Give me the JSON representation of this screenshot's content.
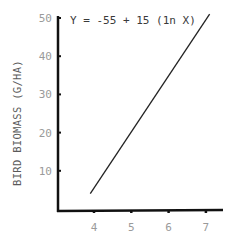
{
  "chart_data": {
    "type": "line",
    "title": "",
    "annotation": "Y = -55 + 15 (1n X)",
    "xlabel": "",
    "ylabel": "BIRD BIOMASS (G/HA)",
    "xlim": [
      3.0,
      7.4
    ],
    "ylim": [
      0,
      50
    ],
    "x_ticks": [
      4,
      5,
      6,
      7
    ],
    "y_ticks": [
      10,
      20,
      30,
      40,
      50
    ],
    "x_tick_labels": [
      "4",
      "5",
      "6",
      "7"
    ],
    "y_tick_labels": [
      "10",
      "20",
      "30",
      "40",
      "50"
    ],
    "grid": false,
    "legend": null,
    "series": [
      {
        "name": "Y = -55 + 15 (ln X)",
        "x": [
          3.9,
          7.1
        ],
        "y": [
          4,
          51
        ]
      }
    ],
    "colors": {
      "axis": "#111111",
      "line": "#222222",
      "tick_label": "#9a9a9a",
      "ylabel": "#5a5a5a"
    }
  }
}
